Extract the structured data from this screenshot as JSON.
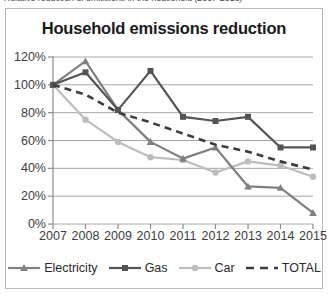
{
  "caption": {
    "text": "Relative reduction of emissions in the household (2007-2015)"
  },
  "chart_data": {
    "type": "line",
    "title": "Household emissions reduction",
    "xlabel": "",
    "ylabel": "",
    "categories": [
      "2007",
      "2008",
      "2009",
      "2010",
      "2011",
      "2012",
      "2013",
      "2014",
      "2015"
    ],
    "x_tick_labels": [
      "2007",
      "2008",
      "2009",
      "2010",
      "2011",
      "2012",
      "2013",
      "2014",
      "2015"
    ],
    "y_tick_labels": [
      "0%",
      "20%",
      "40%",
      "60%",
      "80%",
      "100%",
      "120%"
    ],
    "y_tick_values": [
      0,
      20,
      40,
      60,
      80,
      100,
      120
    ],
    "ylim": [
      0,
      120
    ],
    "grid": "horizontal",
    "legend_position": "bottom",
    "series": [
      {
        "name": "Electricity",
        "marker": "triangle",
        "dash": false,
        "color": "#808080",
        "values": [
          100,
          117,
          82,
          59,
          47,
          55,
          27,
          26,
          8
        ]
      },
      {
        "name": "Gas",
        "marker": "square",
        "dash": false,
        "color": "#545454",
        "values": [
          100,
          109,
          82,
          110,
          77,
          74,
          77,
          55,
          55
        ]
      },
      {
        "name": "Car",
        "marker": "circle",
        "dash": false,
        "color": "#bdbdbd",
        "values": [
          100,
          75,
          59,
          48,
          46,
          37,
          45,
          42,
          34
        ]
      },
      {
        "name": "TOTAL",
        "marker": "none",
        "dash": true,
        "color": "#3d3d3d",
        "values": [
          100,
          93,
          80,
          73,
          65,
          57,
          52,
          45,
          39
        ]
      }
    ]
  },
  "style": {
    "frame_border": "#b9b9b9",
    "grid_color": "#a6a6a6",
    "axis_color": "#8c8c8c",
    "text_color": "#3d3d3d",
    "title_color": "#1a1a1a",
    "background": "#ffffff"
  }
}
